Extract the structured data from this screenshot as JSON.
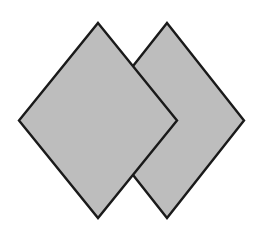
{
  "figure": {
    "canvas": {
      "width": 262,
      "height": 236,
      "background_color": "#ffffff"
    },
    "style": {
      "fill_color": "#bdbdbd",
      "stroke_color": "#1a1a1a",
      "stroke_width": 2.4
    },
    "shapes": [
      {
        "name": "diamond-right",
        "label": "Right diamond",
        "z_order": 1,
        "center": {
          "x": 167,
          "y": 120.5
        },
        "half_width": 77,
        "half_height": 97.5,
        "vertices": [
          {
            "x": 167,
            "y": 23
          },
          {
            "x": 244,
            "y": 120.5
          },
          {
            "x": 167,
            "y": 218
          },
          {
            "x": 90,
            "y": 120.5
          }
        ],
        "points": "167,23 244,120.5 167,218 90,120.5"
      },
      {
        "name": "diamond-left",
        "label": "Left diamond",
        "z_order": 2,
        "center": {
          "x": 98,
          "y": 120.5
        },
        "half_width": 79,
        "half_height": 97.5,
        "vertices": [
          {
            "x": 98,
            "y": 23
          },
          {
            "x": 177,
            "y": 120.5
          },
          {
            "x": 98,
            "y": 218
          },
          {
            "x": 19,
            "y": 120.5
          }
        ],
        "points": "98,23 177,120.5 98,218 19,120.5"
      }
    ]
  }
}
